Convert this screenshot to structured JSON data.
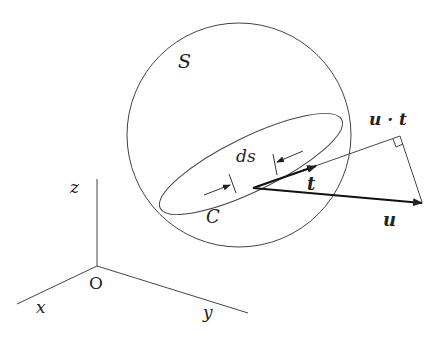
{
  "diagram": {
    "labels": {
      "surface": "S",
      "curve": "C",
      "arc_element": "ds",
      "tangent": "t",
      "vector": "u",
      "projection": "u · t",
      "origin": "O",
      "axis_x": "x",
      "axis_y": "y",
      "axis_z": "z"
    },
    "colors": {
      "stroke": "#444444",
      "text": "#222222",
      "background": "#ffffff"
    }
  }
}
